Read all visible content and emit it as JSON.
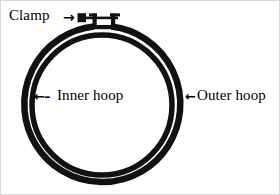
{
  "figure": {
    "background_color": "#ffffff",
    "ink_color": "#111111",
    "border_color": "#d8d8d8",
    "width": 280,
    "height": 195
  },
  "labels": {
    "clamp": {
      "text": "Clamp",
      "arrow": "→",
      "arrow_direction": "right"
    },
    "inner_hoop": {
      "text": "Inner hoop",
      "arrow": "←–",
      "arrow_direction": "left"
    },
    "outer_hoop": {
      "text": "Outer hoop",
      "arrow": "←",
      "arrow_direction": "left"
    }
  },
  "geometry": {
    "center_x": 101,
    "center_y": 103,
    "outer_ring_radius": 78,
    "inner_ring_radius": 70,
    "ring_stroke_width": 6,
    "outer_ring_gap_degrees": 18,
    "clamp_post_height": 13
  },
  "parts": [
    {
      "name": "outer-ring",
      "shape": "circle-with-top-gap"
    },
    {
      "name": "inner-ring",
      "shape": "circle"
    },
    {
      "name": "clamp-assembly",
      "shape": "screw-and-tabs"
    }
  ]
}
